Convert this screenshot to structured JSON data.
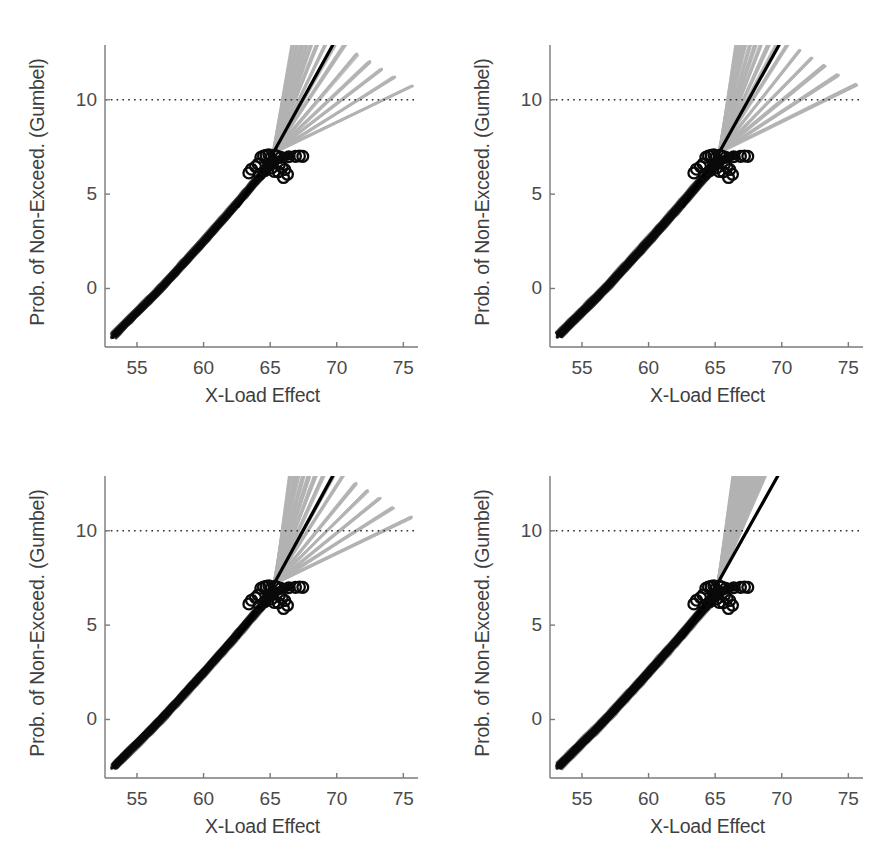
{
  "figure": {
    "panel_count": 4,
    "background": "#ffffff",
    "width": 890,
    "height": 862
  },
  "colors": {
    "axis": "#7a7a7a",
    "tick_text": "#4a4a4a",
    "label_text": "#3f3f3f",
    "data_black": "#0a0a0a",
    "fit_line": "#000000",
    "fan_gray": "#b3b3b3",
    "reference_dotted": "#2e2e2e"
  },
  "axes": {
    "xlabel": "X-Load Effect",
    "ylabel": "Prob. of Non-Exceed. (Gumbel)",
    "xticks": [
      55,
      60,
      65,
      70,
      75
    ],
    "xticklabels": [
      "55",
      "60",
      "65",
      "70",
      "75"
    ],
    "yticks": [
      0,
      5,
      10
    ],
    "yticklabels": [
      "0",
      "5",
      "10"
    ],
    "xlim": [
      52.6,
      76.1
    ],
    "ylim": [
      -3.1,
      12.9
    ],
    "grid": false,
    "reference_line_y": 10
  },
  "chart_data": {
    "type": "line",
    "title": "",
    "xlabel": "X-Load Effect",
    "ylabel": "Prob. of Non-Exceed. (Gumbel)",
    "xlim": [
      52.6,
      76.1
    ],
    "ylim": [
      -3.1,
      12.9
    ],
    "xticks": [
      55,
      60,
      65,
      70,
      75
    ],
    "yticks": [
      0,
      5,
      10
    ],
    "grid": false,
    "legend": null,
    "annotations": [
      {
        "name": "reference-level",
        "type": "hline",
        "y": 10,
        "style": "dotted",
        "color": "#2e2e2e"
      }
    ],
    "panels": [
      {
        "id": "panel-top-left",
        "position": "top-left",
        "series": [
          {
            "name": "measured-data-band",
            "type": "scatter-band",
            "style": "dense black overlapping traces",
            "color": "#0a0a0a",
            "x": [
              53.3,
              54.0,
              55.0,
              56.0,
              57.0,
              58.0,
              59.0,
              60.0,
              61.0,
              62.0,
              63.0,
              64.0,
              64.8,
              65.4,
              66.0,
              66.6
            ],
            "y": [
              -2.45,
              -1.95,
              -1.25,
              -0.55,
              0.18,
              0.95,
              1.72,
              2.5,
              3.3,
              4.1,
              4.92,
              5.75,
              6.35,
              6.75,
              6.95,
              7.05
            ],
            "band_halfwidth": 0.22
          },
          {
            "name": "open-circle-markers",
            "type": "scatter",
            "marker": "o",
            "filled": false,
            "color": "#0a0a0a",
            "x": [
              63.4,
              63.6,
              63.9,
              64.1,
              64.3,
              64.5,
              64.7,
              64.9,
              65.0,
              65.2,
              65.35,
              65.5,
              65.7,
              65.9,
              66.1,
              66.4,
              66.9,
              67.2,
              67.45,
              64.2,
              64.6,
              65.1,
              65.6,
              66.0,
              66.3,
              65.8,
              64.9,
              65.3
            ],
            "y": [
              6.12,
              6.32,
              6.45,
              6.6,
              6.95,
              7.02,
              7.05,
              7.08,
              6.88,
              6.7,
              7.05,
              7.02,
              6.58,
              6.42,
              6.3,
              6.98,
              7.0,
              7.02,
              7.0,
              6.05,
              6.25,
              6.38,
              6.18,
              5.88,
              6.05,
              6.95,
              6.52,
              6.2
            ]
          },
          {
            "name": "extrapolation-fan",
            "type": "line-fan",
            "color": "#b3b3b3",
            "origin": [
              65.25,
              7.2
            ],
            "line_count": 14,
            "end_x": [
              66.7,
              67.0,
              67.35,
              67.7,
              68.1,
              68.5,
              69.1,
              69.8,
              70.6,
              71.5,
              72.4,
              73.3,
              74.3,
              75.6
            ],
            "end_y": [
              12.9,
              12.9,
              12.9,
              12.9,
              12.9,
              12.9,
              12.9,
              12.9,
              12.9,
              12.4,
              12.0,
              11.6,
              11.2,
              10.7
            ]
          },
          {
            "name": "best-fit-line",
            "type": "line",
            "color": "#000000",
            "width": 3.2,
            "x": [
              62.6,
              65.25,
              69.7
            ],
            "y": [
              4.35,
              7.2,
              12.9
            ]
          }
        ]
      },
      {
        "id": "panel-top-right",
        "position": "top-right",
        "series": [
          {
            "name": "measured-data-band",
            "type": "scatter-band",
            "style": "dense black overlapping traces",
            "color": "#0a0a0a",
            "x": [
              53.3,
              54.0,
              55.0,
              56.0,
              57.0,
              58.0,
              59.0,
              60.0,
              61.0,
              62.0,
              63.0,
              64.0,
              64.8,
              65.4,
              66.0,
              66.6
            ],
            "y": [
              -2.45,
              -1.95,
              -1.25,
              -0.55,
              0.18,
              0.95,
              1.72,
              2.5,
              3.3,
              4.1,
              4.92,
              5.75,
              6.35,
              6.75,
              6.95,
              7.05
            ],
            "band_halfwidth": 0.22
          },
          {
            "name": "open-circle-markers",
            "type": "scatter",
            "marker": "o",
            "filled": false,
            "color": "#0a0a0a",
            "x": [
              63.4,
              63.6,
              63.9,
              64.1,
              64.3,
              64.5,
              64.7,
              64.9,
              65.0,
              65.2,
              65.35,
              65.5,
              65.7,
              65.9,
              66.1,
              66.4,
              66.9,
              67.2,
              67.45,
              64.2,
              64.6,
              65.1,
              65.6,
              66.0,
              66.3,
              65.8,
              64.9,
              65.3
            ],
            "y": [
              6.12,
              6.32,
              6.45,
              6.6,
              6.95,
              7.02,
              7.05,
              7.08,
              6.88,
              6.7,
              7.05,
              7.02,
              6.58,
              6.42,
              6.3,
              6.98,
              7.0,
              7.02,
              7.0,
              6.05,
              6.25,
              6.38,
              6.18,
              5.88,
              6.05,
              6.95,
              6.52,
              6.2
            ]
          },
          {
            "name": "extrapolation-fan",
            "type": "line-fan",
            "color": "#b3b3b3",
            "origin": [
              65.3,
              7.2
            ],
            "line_count": 14,
            "end_x": [
              66.6,
              66.9,
              67.2,
              67.6,
              68.0,
              68.4,
              69.0,
              69.6,
              70.4,
              71.3,
              72.2,
              73.2,
              74.2,
              75.6
            ],
            "end_y": [
              12.9,
              12.9,
              12.9,
              12.9,
              12.9,
              12.9,
              12.9,
              12.9,
              12.9,
              12.6,
              12.2,
              11.8,
              11.3,
              10.8
            ]
          },
          {
            "name": "best-fit-line",
            "type": "line",
            "color": "#000000",
            "width": 3.2,
            "x": [
              62.6,
              65.3,
              69.8
            ],
            "y": [
              4.35,
              7.2,
              12.9
            ]
          }
        ]
      },
      {
        "id": "panel-bottom-left",
        "position": "bottom-left",
        "series": [
          {
            "name": "measured-data-band",
            "type": "scatter-band",
            "style": "dense black overlapping traces",
            "color": "#0a0a0a",
            "x": [
              53.3,
              54.0,
              55.0,
              56.0,
              57.0,
              58.0,
              59.0,
              60.0,
              61.0,
              62.0,
              63.0,
              64.0,
              64.8,
              65.4,
              66.0,
              66.6
            ],
            "y": [
              -2.45,
              -1.95,
              -1.25,
              -0.55,
              0.18,
              0.95,
              1.72,
              2.5,
              3.3,
              4.1,
              4.92,
              5.75,
              6.35,
              6.75,
              6.95,
              7.05
            ],
            "band_halfwidth": 0.22
          },
          {
            "name": "open-circle-markers",
            "type": "scatter",
            "marker": "o",
            "filled": false,
            "color": "#0a0a0a",
            "x": [
              63.4,
              63.6,
              63.9,
              64.1,
              64.3,
              64.5,
              64.7,
              64.9,
              65.0,
              65.2,
              65.35,
              65.5,
              65.7,
              65.9,
              66.1,
              66.4,
              66.9,
              67.2,
              67.45,
              64.2,
              64.6,
              65.1,
              65.6,
              66.0,
              66.3,
              65.8,
              64.9,
              65.3
            ],
            "y": [
              6.12,
              6.32,
              6.45,
              6.6,
              6.95,
              7.02,
              7.05,
              7.08,
              6.88,
              6.7,
              7.05,
              7.02,
              6.58,
              6.42,
              6.3,
              6.98,
              7.0,
              7.02,
              7.0,
              6.05,
              6.25,
              6.38,
              6.18,
              5.88,
              6.05,
              6.95,
              6.52,
              6.2
            ]
          },
          {
            "name": "extrapolation-fan",
            "type": "line-fan",
            "color": "#b3b3b3",
            "origin": [
              65.3,
              7.2
            ],
            "line_count": 14,
            "end_x": [
              66.5,
              66.8,
              67.1,
              67.5,
              67.9,
              68.4,
              69.0,
              69.7,
              70.5,
              71.4,
              72.3,
              73.2,
              74.2,
              75.6
            ],
            "end_y": [
              12.9,
              12.9,
              12.9,
              12.9,
              12.9,
              12.9,
              12.9,
              12.9,
              12.9,
              12.5,
              12.1,
              11.7,
              11.2,
              10.7
            ]
          },
          {
            "name": "best-fit-line",
            "type": "line",
            "color": "#000000",
            "width": 3.2,
            "x": [
              62.6,
              65.3,
              69.7
            ],
            "y": [
              4.35,
              7.2,
              12.9
            ]
          }
        ]
      },
      {
        "id": "panel-bottom-right",
        "position": "bottom-right",
        "series": [
          {
            "name": "measured-data-band",
            "type": "scatter-band",
            "style": "dense black overlapping traces",
            "color": "#0a0a0a",
            "x": [
              53.3,
              54.0,
              55.0,
              56.0,
              57.0,
              58.0,
              59.0,
              60.0,
              61.0,
              62.0,
              63.0,
              64.0,
              64.8,
              65.4,
              66.0,
              66.6
            ],
            "y": [
              -2.45,
              -1.95,
              -1.25,
              -0.55,
              0.18,
              0.95,
              1.72,
              2.5,
              3.3,
              4.1,
              4.92,
              5.75,
              6.35,
              6.75,
              6.95,
              7.05
            ],
            "band_halfwidth": 0.22
          },
          {
            "name": "open-circle-markers",
            "type": "scatter",
            "marker": "o",
            "filled": false,
            "color": "#0a0a0a",
            "x": [
              63.4,
              63.6,
              63.9,
              64.1,
              64.3,
              64.5,
              64.7,
              64.9,
              65.0,
              65.2,
              65.35,
              65.5,
              65.7,
              65.9,
              66.1,
              66.4,
              66.9,
              67.2,
              67.45,
              64.2,
              64.6,
              65.1,
              65.6,
              66.0,
              66.3,
              65.8,
              64.9,
              65.3
            ],
            "y": [
              6.12,
              6.32,
              6.45,
              6.6,
              6.95,
              7.02,
              7.05,
              7.08,
              6.88,
              6.7,
              7.05,
              7.02,
              6.58,
              6.42,
              6.3,
              6.98,
              7.0,
              7.02,
              7.0,
              6.05,
              6.25,
              6.38,
              6.18,
              5.88,
              6.05,
              6.95,
              6.52,
              6.2
            ]
          },
          {
            "name": "extrapolation-fan",
            "type": "line-fan",
            "color": "#b3b3b3",
            "style": "narrow dense band",
            "origin": [
              65.25,
              7.3
            ],
            "line_count": 16,
            "end_x": [
              66.4,
              66.5,
              66.6,
              66.7,
              66.8,
              66.9,
              67.0,
              67.1,
              67.2,
              67.35,
              67.5,
              67.7,
              67.9,
              68.1,
              68.4,
              68.7
            ],
            "end_y": [
              12.9,
              12.9,
              12.9,
              12.9,
              12.9,
              12.9,
              12.9,
              12.9,
              12.9,
              12.9,
              12.9,
              12.9,
              12.9,
              12.9,
              12.9,
              12.9
            ]
          },
          {
            "name": "best-fit-line",
            "type": "line",
            "color": "#000000",
            "width": 3.2,
            "x": [
              62.6,
              65.25,
              69.7
            ],
            "y": [
              4.35,
              7.3,
              12.9
            ]
          }
        ]
      }
    ]
  }
}
